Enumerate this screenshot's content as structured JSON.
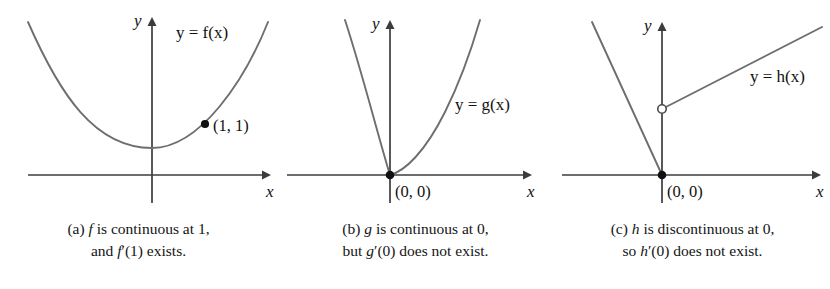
{
  "figure": {
    "background_color": "#ffffff",
    "curve_color": "#6e6e6e",
    "axis_color": "#3c3c3c",
    "text_color": "#111111"
  },
  "panels": [
    {
      "id": "a",
      "curve_label": "y = f(x)",
      "x_axis_label": "x",
      "y_axis_label": "y",
      "point_label": "(1, 1)",
      "point_marker": "filled-dot",
      "caption_line1": "(a)  f is continuous at 1,",
      "caption_line2": "and f′(1) exists.",
      "caption_tag": "(a)",
      "caption_fn": "f",
      "caption_rest1": "is continuous at 1,",
      "caption_fn2": "f′(1)",
      "caption_rest2": "exists.",
      "caption_lead2": "and"
    },
    {
      "id": "b",
      "curve_label": "y = g(x)",
      "x_axis_label": "x",
      "y_axis_label": "y",
      "point_label": "(0, 0)",
      "point_marker": "filled-dot",
      "caption_line1": "(b)  g is continuous at 0,",
      "caption_line2": "but g′(0) does not exist.",
      "caption_tag": "(b)",
      "caption_fn": "g",
      "caption_rest1": "is continuous at 0,",
      "caption_fn2": "g′(0)",
      "caption_rest2": "does not exist.",
      "caption_lead2": "but"
    },
    {
      "id": "c",
      "curve_label": "y = h(x)",
      "x_axis_label": "x",
      "y_axis_label": "y",
      "point_label": "(0, 0)",
      "point_marker": "filled-dot",
      "open_point_marker": "open-circle",
      "caption_line1": "(c)  h is discontinuous at 0,",
      "caption_line2": "so h′(0) does not exist.",
      "caption_tag": "(c)",
      "caption_fn": "h",
      "caption_rest1": "is discontinuous at 0,",
      "caption_fn2": "h′(0)",
      "caption_rest2": "does not exist.",
      "caption_lead2": "so"
    }
  ],
  "chart_data": [
    {
      "type": "line",
      "panel": "a",
      "title": "y = f(x)",
      "description": "Smooth upward parabola with a marked point at (1, 1) where the tangent exists",
      "xlabel": "x",
      "ylabel": "y",
      "grid": false,
      "legend": "none",
      "xlim": [
        -2.6,
        1.9
      ],
      "ylim": [
        -1.1,
        5.2
      ],
      "origin_px": [
        152,
        175
      ],
      "series": [
        {
          "name": "f",
          "marker_points": [
            {
              "x": 1,
              "y": 1,
              "label": "(1, 1)",
              "style": "filled"
            }
          ],
          "path_px": "M 28,22 C 60,95 95,148 152,148 C 200,148 245,80 268,22"
        }
      ]
    },
    {
      "type": "line",
      "panel": "b",
      "title": "y = g(x)",
      "description": "Cusp at the origin: continuous but no tangent line (vertical/non-existent derivative)",
      "xlabel": "x",
      "ylabel": "y",
      "grid": false,
      "legend": "none",
      "xlim": [
        -1.5,
        2.2
      ],
      "ylim": [
        -1.1,
        5.2
      ],
      "origin_px": [
        113,
        175
      ],
      "series": [
        {
          "name": "g",
          "marker_points": [
            {
              "x": 0,
              "y": 0,
              "label": "(0, 0)",
              "style": "filled"
            }
          ],
          "path_px": "M 68,20 C 85,72 100,132 113,175 C 128,171 148,152 168,112 C 186,76 196,44 203,20"
        }
      ]
    },
    {
      "type": "line",
      "panel": "c",
      "title": "y = h(x)",
      "description": "Jump discontinuity at 0: steep line falls to a filled point at the origin, and a shallower ray starts at an open circle above the origin",
      "xlabel": "x",
      "ylabel": "y",
      "grid": false,
      "legend": "none",
      "xlim": [
        -1.2,
        2.4
      ],
      "ylim": [
        -1.1,
        5.2
      ],
      "origin_px": [
        108,
        175
      ],
      "series": [
        {
          "name": "h left branch",
          "marker_points": [
            {
              "x": 0,
              "y": 0,
              "label": "(0, 0)",
              "style": "filled"
            }
          ],
          "path_px": "M 38,22 L 108,175"
        },
        {
          "name": "h right branch",
          "marker_points": [
            {
              "x": 0,
              "y": 2.2,
              "label": "",
              "style": "open"
            }
          ],
          "path_px": "M 108,109 L 268,27"
        }
      ]
    }
  ]
}
